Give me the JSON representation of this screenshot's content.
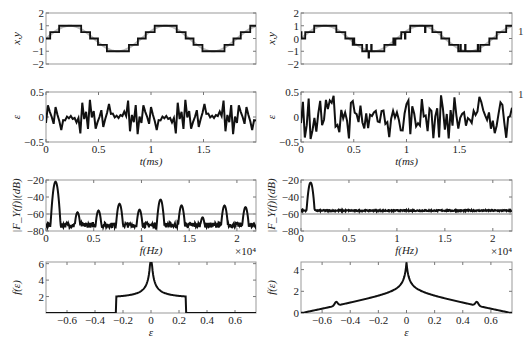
{
  "figure": {
    "columns": [
      "left",
      "right"
    ],
    "side_marks": [
      "1",
      "1"
    ]
  },
  "chart_data": [
    {
      "id": "left-xy",
      "type": "line",
      "position": "row1-left",
      "ylabel": "x,y",
      "xlabel": "",
      "ylim": [
        -2,
        2
      ],
      "xlim": [
        0,
        2
      ],
      "yticks": [
        -2,
        -1,
        0,
        1,
        2
      ],
      "xticks": [],
      "series": [
        {
          "name": "x (original sine)",
          "color": "#bbbbbb",
          "kind": "sine",
          "amplitude": 1,
          "periods": 2.2
        },
        {
          "name": "y (quantized)",
          "color": "#111111",
          "kind": "quantized",
          "levels": [
            -1,
            -0.5,
            0,
            0.5,
            1
          ],
          "step": 0.5
        }
      ]
    },
    {
      "id": "right-xy",
      "type": "line",
      "position": "row1-right",
      "ylabel": "x,y",
      "xlabel": "",
      "ylim": [
        -2,
        2
      ],
      "xlim": [
        0,
        2
      ],
      "yticks": [
        -2,
        -1,
        0,
        1,
        2
      ],
      "xticks": [],
      "series": [
        {
          "name": "x (original sine)",
          "color": "#bbbbbb",
          "kind": "sine",
          "amplitude": 1,
          "periods": 2.2
        },
        {
          "name": "y (dithered quantized)",
          "color": "#111111",
          "kind": "dithered",
          "step": 0.5
        }
      ]
    },
    {
      "id": "left-error",
      "type": "line",
      "position": "row2-left",
      "ylabel": "ε",
      "xlabel": "t(ms)",
      "ylim": [
        -0.5,
        0.5
      ],
      "xlim": [
        0,
        2
      ],
      "yticks": [
        -0.5,
        0,
        0.5
      ],
      "xticks": [
        0,
        0.5,
        1,
        1.5
      ],
      "series": [
        {
          "name": "quantization error",
          "color": "#111111",
          "range": [
            -0.25,
            0.25
          ]
        }
      ]
    },
    {
      "id": "right-error",
      "type": "line",
      "position": "row2-right",
      "ylabel": "ε",
      "xlabel": "t(ms)",
      "ylim": [
        -0.5,
        0.5
      ],
      "xlim": [
        0,
        2
      ],
      "yticks": [
        -0.5,
        0,
        0.5
      ],
      "xticks": [
        0,
        0.5,
        1,
        1.5
      ],
      "series": [
        {
          "name": "quantization error (dithered)",
          "color": "#111111",
          "range": [
            -0.5,
            0.5
          ]
        }
      ]
    },
    {
      "id": "left-spectrum",
      "type": "line",
      "position": "row3-left",
      "ylabel": "|F_Y(f)|(dB)",
      "xlabel": "f(Hz)",
      "x_multiplier": "×10⁴",
      "ylim": [
        -80,
        -20
      ],
      "xlim": [
        0,
        2.2
      ],
      "yticks": [
        -80,
        -60,
        -40,
        -20
      ],
      "xticks": [
        0,
        0.5,
        1,
        1.5,
        2
      ],
      "reference_line": {
        "y": -60,
        "color": "#aaaaaa"
      },
      "baseline": -73,
      "peaks": [
        {
          "f": 0.1,
          "db": -22
        },
        {
          "f": 0.33,
          "db": -58
        },
        {
          "f": 0.55,
          "db": -56
        },
        {
          "f": 0.77,
          "db": -48
        },
        {
          "f": 0.98,
          "db": -55
        },
        {
          "f": 1.2,
          "db": -43
        },
        {
          "f": 1.42,
          "db": -50
        },
        {
          "f": 1.64,
          "db": -64
        },
        {
          "f": 1.87,
          "db": -50
        },
        {
          "f": 2.09,
          "db": -52
        }
      ]
    },
    {
      "id": "right-spectrum",
      "type": "line",
      "position": "row3-right",
      "ylabel": "|F_Y(f)|(dB)",
      "xlabel": "f(Hz)",
      "x_multiplier": "×10⁴",
      "ylim": [
        -80,
        -20
      ],
      "xlim": [
        0,
        2.2
      ],
      "yticks": [
        -80,
        -60,
        -40,
        -20
      ],
      "xticks": [
        0,
        0.5,
        1,
        1.5,
        2
      ],
      "reference_line": {
        "y": -60,
        "color": "#aaaaaa"
      },
      "baseline": -56,
      "peaks": [
        {
          "f": 0.1,
          "db": -23
        }
      ]
    },
    {
      "id": "left-pdf",
      "type": "line",
      "position": "row4-left",
      "ylabel": "f(ε)",
      "xlabel": "ε",
      "ylim": [
        0,
        6.2
      ],
      "xlim": [
        -0.75,
        0.75
      ],
      "yticks": [
        2,
        4,
        6
      ],
      "xticks": [
        -0.6,
        -0.4,
        -0.2,
        0,
        0.2,
        0.4,
        0.6
      ],
      "shape": "uniform with central spike",
      "support": [
        -0.25,
        0.25
      ],
      "plateau": 1.7,
      "peak": 6.2
    },
    {
      "id": "right-pdf",
      "type": "line",
      "position": "row4-right",
      "ylabel": "f(ε)",
      "xlabel": "ε",
      "ylim": [
        0,
        4.7
      ],
      "xlim": [
        -0.75,
        0.75
      ],
      "yticks": [
        0,
        2,
        4
      ],
      "xticks": [
        -0.6,
        -0.4,
        -0.2,
        0,
        0.2,
        0.4,
        0.6
      ],
      "shape": "triangular with central spike",
      "support": [
        -0.7,
        0.7
      ],
      "peak": 4.7,
      "side_bumps": [
        {
          "x": -0.5,
          "y": 0.7
        },
        {
          "x": 0.5,
          "y": 0.7
        }
      ]
    }
  ]
}
